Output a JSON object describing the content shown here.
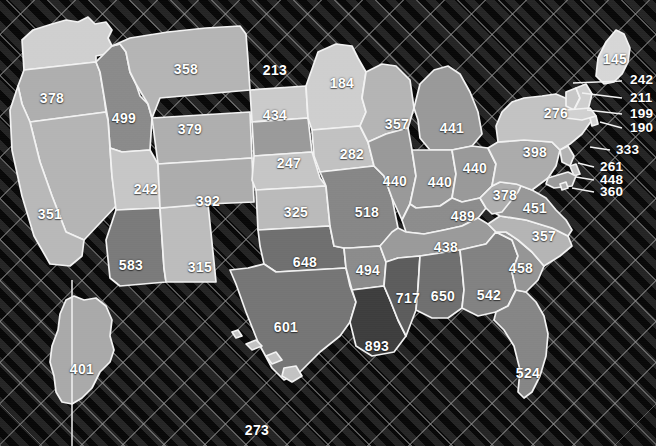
{
  "figure": {
    "type": "choropleth-map",
    "region": "United States",
    "background_pattern": "dark-diagonal-crosshatch",
    "border_color": "#f2f2f2",
    "label_color": "#ffffff",
    "scale_min_color": "#dcdcdc",
    "scale_max_color": "#3a3a3a"
  },
  "chart_data": {
    "type": "heatmap",
    "title": "",
    "xlabel": "",
    "ylabel": "",
    "value_min": 145,
    "value_max": 893,
    "categories": [
      "WA",
      "OR",
      "ID",
      "MT",
      "WY",
      "NV",
      "UT",
      "CA",
      "AZ",
      "NM",
      "CO",
      "ND",
      "SD",
      "NE",
      "KS",
      "OK",
      "TX",
      "MN",
      "IA",
      "MO",
      "AR",
      "LA",
      "WI",
      "IL",
      "MI",
      "IN",
      "OH",
      "KY",
      "TN",
      "MS",
      "AL",
      "GA",
      "FL",
      "SC",
      "NC",
      "VA",
      "WV",
      "PA",
      "NY",
      "ME",
      "VT",
      "NH",
      "MA",
      "RI",
      "NJ",
      "DE",
      "MD",
      "DC",
      "AK",
      "HI"
    ],
    "values": [
      null,
      378,
      499,
      358,
      379,
      351,
      242,
      null,
      583,
      315,
      392,
      213,
      434,
      247,
      325,
      648,
      601,
      184,
      282,
      518,
      494,
      893,
      357,
      440,
      441,
      440,
      440,
      489,
      438,
      717,
      650,
      542,
      524,
      458,
      357,
      451,
      378,
      398,
      276,
      145,
      242,
      211,
      199,
      190,
      333,
      261,
      448,
      360,
      401,
      273
    ]
  },
  "states": [
    {
      "code": "WA",
      "name": "Washington",
      "value": null,
      "label": "",
      "x": 78,
      "y": 50,
      "fill": "#cfcfcf"
    },
    {
      "code": "OR",
      "name": "Oregon",
      "value": 378,
      "label": "378",
      "x": 52,
      "y": 98,
      "fill": "#aeaeae"
    },
    {
      "code": "ID",
      "name": "Idaho",
      "value": 499,
      "label": "499",
      "x": 124,
      "y": 118,
      "fill": "#8a8a8a"
    },
    {
      "code": "MT",
      "name": "Montana",
      "value": 358,
      "label": "358",
      "x": 186,
      "y": 69,
      "fill": "#b4b4b4"
    },
    {
      "code": "WY",
      "name": "Wyoming",
      "value": 379,
      "label": "379",
      "x": 190,
      "y": 129,
      "fill": "#aeaeae"
    },
    {
      "code": "NV",
      "name": "Nevada",
      "value": 351,
      "label": "351",
      "x": 50,
      "y": 214,
      "fill": "#b4b4b4"
    },
    {
      "code": "UT",
      "name": "Utah",
      "value": 242,
      "label": "242",
      "x": 146,
      "y": 189,
      "fill": "#c6c6c6"
    },
    {
      "code": "CA",
      "name": "California",
      "value": null,
      "label": "",
      "x": 28,
      "y": 250,
      "fill": "#b8b8b8"
    },
    {
      "code": "AZ",
      "name": "Arizona",
      "value": 583,
      "label": "583",
      "x": 131,
      "y": 265,
      "fill": "#7a7a7a"
    },
    {
      "code": "NM",
      "name": "New Mexico",
      "value": 315,
      "label": "315",
      "x": 200,
      "y": 267,
      "fill": "#bcbcbc"
    },
    {
      "code": "CO",
      "name": "Colorado",
      "value": 392,
      "label": "392",
      "x": 208,
      "y": 201,
      "fill": "#acacac"
    },
    {
      "code": "ND",
      "name": "North Dakota",
      "value": 213,
      "label": "213",
      "x": 275,
      "y": 70,
      "fill": "#cacaca"
    },
    {
      "code": "SD",
      "name": "South Dakota",
      "value": 434,
      "label": "434",
      "x": 275,
      "y": 115,
      "fill": "#9a9a9a"
    },
    {
      "code": "NE",
      "name": "Nebraska",
      "value": 247,
      "label": "247",
      "x": 289,
      "y": 163,
      "fill": "#c5c5c5"
    },
    {
      "code": "KS",
      "name": "Kansas",
      "value": 325,
      "label": "325",
      "x": 296,
      "y": 212,
      "fill": "#bababa"
    },
    {
      "code": "OK",
      "name": "Oklahoma",
      "value": 648,
      "label": "648",
      "x": 305,
      "y": 262,
      "fill": "#6f6f6f"
    },
    {
      "code": "TX",
      "name": "Texas",
      "value": 601,
      "label": "601",
      "x": 286,
      "y": 327,
      "fill": "#757575"
    },
    {
      "code": "MN",
      "name": "Minnesota",
      "value": 184,
      "label": "184",
      "x": 342,
      "y": 83,
      "fill": "#cecece"
    },
    {
      "code": "IA",
      "name": "Iowa",
      "value": 282,
      "label": "282",
      "x": 352,
      "y": 154,
      "fill": "#c1c1c1"
    },
    {
      "code": "MO",
      "name": "Missouri",
      "value": 518,
      "label": "518",
      "x": 367,
      "y": 212,
      "fill": "#868686"
    },
    {
      "code": "AR",
      "name": "Arkansas",
      "value": 494,
      "label": "494",
      "x": 368,
      "y": 270,
      "fill": "#8b8b8b"
    },
    {
      "code": "LA",
      "name": "Louisiana",
      "value": 893,
      "label": "893",
      "x": 377,
      "y": 346,
      "fill": "#3d3d3d"
    },
    {
      "code": "WI",
      "name": "Wisconsin",
      "value": 357,
      "label": "357",
      "x": 397,
      "y": 124,
      "fill": "#b4b4b4"
    },
    {
      "code": "IL",
      "name": "Illinois",
      "value": 440,
      "label": "440",
      "x": 395,
      "y": 181,
      "fill": "#999999"
    },
    {
      "code": "MI",
      "name": "Michigan",
      "value": 441,
      "label": "441",
      "x": 452,
      "y": 128,
      "fill": "#999999"
    },
    {
      "code": "IN",
      "name": "Indiana",
      "value": 440,
      "label": "440",
      "x": 440,
      "y": 182,
      "fill": "#999999"
    },
    {
      "code": "OH",
      "name": "Ohio",
      "value": 440,
      "label": "440",
      "x": 475,
      "y": 168,
      "fill": "#999999"
    },
    {
      "code": "KY",
      "name": "Kentucky",
      "value": 489,
      "label": "489",
      "x": 463,
      "y": 216,
      "fill": "#8c8c8c"
    },
    {
      "code": "TN",
      "name": "Tennessee",
      "value": 438,
      "label": "438",
      "x": 446,
      "y": 247,
      "fill": "#9a9a9a"
    },
    {
      "code": "MS",
      "name": "Mississippi",
      "value": 717,
      "label": "717",
      "x": 408,
      "y": 298,
      "fill": "#5c5c5c"
    },
    {
      "code": "AL",
      "name": "Alabama",
      "value": 650,
      "label": "650",
      "x": 443,
      "y": 296,
      "fill": "#6f6f6f"
    },
    {
      "code": "GA",
      "name": "Georgia",
      "value": 542,
      "label": "542",
      "x": 489,
      "y": 295,
      "fill": "#818181"
    },
    {
      "code": "FL",
      "name": "Florida",
      "value": 524,
      "label": "524",
      "x": 528,
      "y": 373,
      "fill": "#858585"
    },
    {
      "code": "SC",
      "name": "South Carolina",
      "value": 458,
      "label": "458",
      "x": 521,
      "y": 268,
      "fill": "#959595"
    },
    {
      "code": "NC",
      "name": "North Carolina",
      "value": 357,
      "label": "357",
      "x": 544,
      "y": 236,
      "fill": "#b4b4b4"
    },
    {
      "code": "VA",
      "name": "Virginia",
      "value": 451,
      "label": "451",
      "x": 535,
      "y": 208,
      "fill": "#979797"
    },
    {
      "code": "WV",
      "name": "West Virginia",
      "value": 378,
      "label": "378",
      "x": 505,
      "y": 195,
      "fill": "#aeaeae"
    },
    {
      "code": "PA",
      "name": "Pennsylvania",
      "value": 398,
      "label": "398",
      "x": 535,
      "y": 152,
      "fill": "#ababab"
    },
    {
      "code": "NY",
      "name": "New York",
      "value": 276,
      "label": "276",
      "x": 556,
      "y": 113,
      "fill": "#c2c2c2"
    },
    {
      "code": "ME",
      "name": "Maine",
      "value": 145,
      "label": "145",
      "x": 615,
      "y": 59,
      "fill": "#d6d6d6"
    },
    {
      "code": "AK",
      "name": "Alaska",
      "value": 401,
      "label": "401",
      "x": 82,
      "y": 369,
      "fill": "#a9a9a9"
    },
    {
      "code": "HI",
      "name": "Hawaii",
      "value": 273,
      "label": "273",
      "x": 257,
      "y": 430,
      "fill": "#c2c2c2"
    }
  ],
  "callouts": [
    {
      "code": "VT",
      "name": "Vermont",
      "value": 242,
      "label": "242",
      "x": 630,
      "y": 80,
      "line": {
        "x1": 573,
        "y1": 83,
        "x2": 622,
        "y2": 81
      }
    },
    {
      "code": "NH",
      "name": "New Hampshire",
      "value": 211,
      "label": "211",
      "x": 630,
      "y": 98,
      "line": {
        "x1": 582,
        "y1": 93,
        "x2": 622,
        "y2": 98
      }
    },
    {
      "code": "MA",
      "name": "Massachusetts",
      "value": 199,
      "label": "199",
      "x": 630,
      "y": 114,
      "line": {
        "x1": 587,
        "y1": 110,
        "x2": 622,
        "y2": 114
      }
    },
    {
      "code": "RI",
      "name": "Rhode Island",
      "value": 190,
      "label": "190",
      "x": 630,
      "y": 128,
      "line": {
        "x1": 600,
        "y1": 122,
        "x2": 622,
        "y2": 128
      }
    },
    {
      "code": "NJ",
      "name": "New Jersey",
      "value": 333,
      "label": "333",
      "x": 616,
      "y": 150,
      "line": {
        "x1": 590,
        "y1": 147,
        "x2": 610,
        "y2": 150
      }
    },
    {
      "code": "DE",
      "name": "Delaware",
      "value": 261,
      "label": "261",
      "x": 600,
      "y": 167,
      "line": {
        "x1": 578,
        "y1": 163,
        "x2": 594,
        "y2": 167
      }
    },
    {
      "code": "MD",
      "name": "Maryland",
      "value": 448,
      "label": "448",
      "x": 600,
      "y": 180,
      "line": {
        "x1": 576,
        "y1": 177,
        "x2": 594,
        "y2": 180
      }
    },
    {
      "code": "DC",
      "name": "District of Columbia",
      "value": 360,
      "label": "360",
      "x": 600,
      "y": 192,
      "line": {
        "x1": 572,
        "y1": 188,
        "x2": 594,
        "y2": 192
      }
    }
  ]
}
